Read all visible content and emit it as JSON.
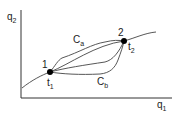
{
  "axes": {
    "x_label": "q",
    "x_sub": "1",
    "y_label": "q",
    "y_sub": "2"
  },
  "points": [
    {
      "label": "1",
      "time": "t",
      "time_sub": "1"
    },
    {
      "label": "2",
      "time": "t",
      "time_sub": "2"
    }
  ],
  "paths": [
    {
      "label": "C",
      "sub": "a"
    },
    {
      "label": "C",
      "sub": "b"
    }
  ],
  "colors": {
    "line": "#333333",
    "point": "#000000"
  }
}
